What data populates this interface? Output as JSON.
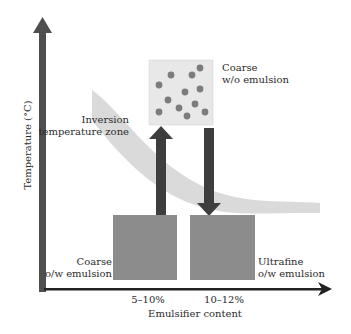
{
  "axes": {
    "y_label": "Temperature (°C)",
    "x_label": "Emulsifier content",
    "x_ticks": [
      "5–10%",
      "10–12%"
    ]
  },
  "zone": {
    "label_line1": "Inversion",
    "label_line2": "temperature zone"
  },
  "boxes": {
    "top": {
      "line1": "Coarse",
      "line2": "w/o emulsion"
    },
    "bottom_left": {
      "line1": "Coarse",
      "line2": "o/w emulsion"
    },
    "bottom_right": {
      "line1": "Ultrafine",
      "line2": "o/w emulsion"
    }
  },
  "colors": {
    "axis": "#4a4a4a",
    "box": "#8a8a8a",
    "top_box": "#e6e6e6",
    "droplet": "#7a7a7a",
    "zone": "#d4d4d4",
    "arrow": "#3c3c3c"
  }
}
